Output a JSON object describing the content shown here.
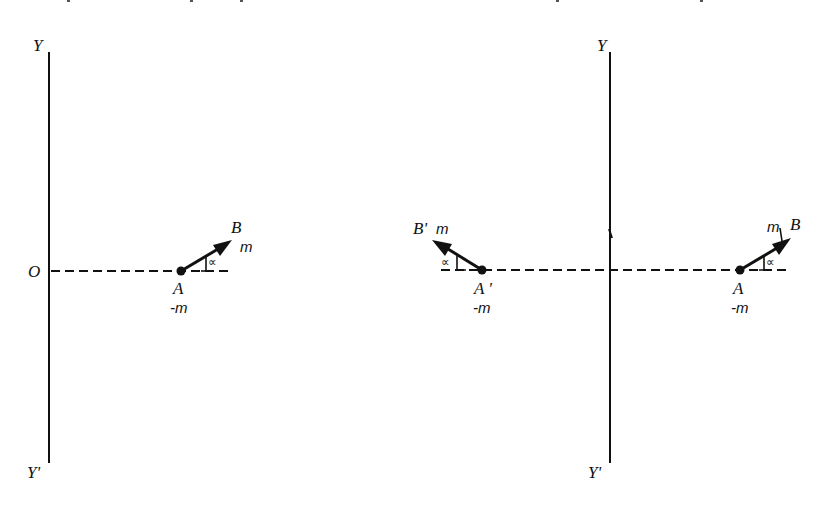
{
  "figure": {
    "colors": {
      "ink": "#111111",
      "background": "#ffffff"
    }
  },
  "left_diagram": {
    "axis_top_label": "Y",
    "axis_bottom_label": "Y'",
    "origin_label": "O",
    "point_A_label": "A",
    "point_A_charge": "-m",
    "point_B_label": "B",
    "point_B_charge": "m",
    "angle_label": "∝"
  },
  "right_diagram": {
    "axis_top_label": "Y",
    "axis_bottom_label": "Y'",
    "image_point_A_label": "A '",
    "image_point_A_charge": "-m",
    "image_point_B_label": "B'",
    "image_point_B_charge": "m",
    "image_angle_label": "∝",
    "point_A_label": "A",
    "point_A_charge": "-m",
    "point_B_label": "B",
    "point_B_charge": "m",
    "angle_label": "∝"
  }
}
